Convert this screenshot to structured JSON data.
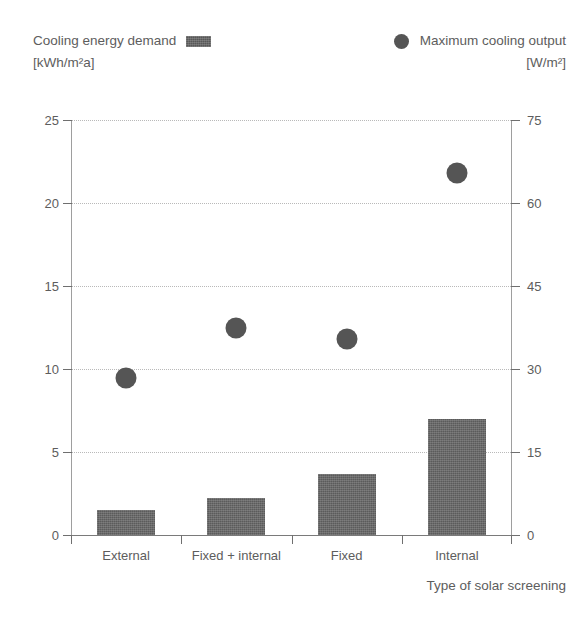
{
  "legend": {
    "left": {
      "label": "Cooling energy demand",
      "unit": "[kWh/m²a]",
      "swatch": "bar-swatch",
      "color": "#5b5b5b"
    },
    "right": {
      "label": "Maximum cooling output",
      "unit": "[W/m²]",
      "swatch": "dot-swatch",
      "color": "#555555"
    }
  },
  "axes": {
    "left_ticks": [
      "25",
      "20",
      "15",
      "10",
      "5",
      "0"
    ],
    "right_ticks": [
      "75",
      "60",
      "45",
      "30",
      "15",
      "0"
    ],
    "x_title": "Type of solar screening"
  },
  "chart_data": {
    "type": "bar",
    "title": "",
    "xlabel": "Type of solar screening",
    "ylabel": "Cooling energy demand [kWh/m²a]",
    "y2label": "Maximum cooling output [W/m²]",
    "categories": [
      "External",
      "Fixed + internal",
      "Fixed",
      "Internal"
    ],
    "ylim": [
      0,
      25
    ],
    "y2lim": [
      0,
      75
    ],
    "yticks": [
      0,
      5,
      10,
      15,
      20,
      25
    ],
    "y2ticks": [
      0,
      15,
      30,
      45,
      60,
      75
    ],
    "grid": "horizontal-dotted",
    "legend_position": "top",
    "series": [
      {
        "name": "Cooling energy demand",
        "unit": "kWh/m²a",
        "type": "bar",
        "axis": "left",
        "color": "#5b5b5b",
        "values": [
          1.5,
          2.2,
          3.65,
          7.0
        ]
      },
      {
        "name": "Maximum cooling output",
        "unit": "W/m²",
        "type": "scatter",
        "axis": "right",
        "color": "#555555",
        "values": [
          28.3,
          37.5,
          35.5,
          65.5
        ]
      }
    ]
  }
}
